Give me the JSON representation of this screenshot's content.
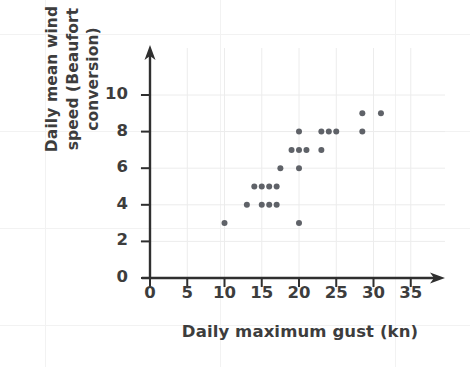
{
  "chart_data": {
    "type": "scatter",
    "title": "",
    "xlabel": "Daily maximum gust (kn)",
    "ylabel": "Daily mean wind speed (Beaufort conversion)",
    "ylabel_lines": [
      "Daily mean wind",
      "speed (Beaufort",
      "conversion)"
    ],
    "xlim": [
      0,
      37
    ],
    "ylim": [
      0,
      11
    ],
    "xticks": [
      0,
      5,
      10,
      15,
      20,
      25,
      30,
      35
    ],
    "yticks": [
      0,
      2,
      4,
      6,
      8,
      10
    ],
    "xtick_labels": [
      "0",
      "5",
      "10",
      "15",
      "20",
      "25",
      "30",
      "35"
    ],
    "ytick_labels": [
      "0",
      "2",
      "4",
      "6",
      "8",
      "10"
    ],
    "grid": "faint",
    "legend": "none",
    "marker": {
      "shape": "circle",
      "color": "#5f6268",
      "size_px": 6
    },
    "axis_color": "#2f2f2f",
    "points": [
      {
        "x": 10.0,
        "y": 3
      },
      {
        "x": 13.0,
        "y": 4
      },
      {
        "x": 14.0,
        "y": 5
      },
      {
        "x": 15.0,
        "y": 5
      },
      {
        "x": 15.0,
        "y": 4
      },
      {
        "x": 16.0,
        "y": 5
      },
      {
        "x": 16.0,
        "y": 4
      },
      {
        "x": 17.0,
        "y": 5
      },
      {
        "x": 17.0,
        "y": 4
      },
      {
        "x": 17.5,
        "y": 6
      },
      {
        "x": 19.0,
        "y": 7
      },
      {
        "x": 20.0,
        "y": 8
      },
      {
        "x": 20.0,
        "y": 7
      },
      {
        "x": 20.0,
        "y": 6
      },
      {
        "x": 20.0,
        "y": 3
      },
      {
        "x": 21.0,
        "y": 7
      },
      {
        "x": 23.0,
        "y": 8
      },
      {
        "x": 23.0,
        "y": 7
      },
      {
        "x": 24.0,
        "y": 8
      },
      {
        "x": 25.0,
        "y": 8
      },
      {
        "x": 28.5,
        "y": 9
      },
      {
        "x": 28.5,
        "y": 8
      },
      {
        "x": 31.0,
        "y": 9
      }
    ]
  }
}
